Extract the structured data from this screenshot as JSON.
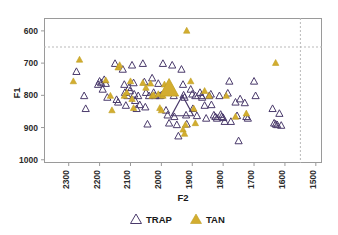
{
  "chart_data": {
    "type": "scatter",
    "title": "",
    "xlabel": "F2",
    "ylabel": "F1",
    "xlim": [
      2380,
      1480
    ],
    "ylim": [
      1010,
      560
    ],
    "x_inverted": true,
    "y_inverted": true,
    "grid": false,
    "legend_position": "bottom-center",
    "xticks": [
      2300,
      2200,
      2100,
      2000,
      1900,
      1800,
      1700,
      1600,
      1500
    ],
    "xtick_labels": [
      "2300",
      "2200",
      "2100",
      "2000",
      "1900",
      "1800",
      "1700",
      "1600",
      "1500"
    ],
    "yticks": [
      600,
      700,
      800,
      900,
      1000
    ],
    "ytick_labels": [
      "600",
      "700",
      "800",
      "900",
      "1000"
    ],
    "reference_lines": [
      {
        "orientation": "horizontal",
        "value": 650,
        "style": "dashed",
        "color": "#b9b9b9"
      },
      {
        "orientation": "vertical",
        "value": 1550,
        "style": "dashed",
        "color": "#b9b9b9"
      }
    ],
    "legend": [
      {
        "name": "TRAP",
        "marker": "triangle-open",
        "color": "#4a3a6b"
      },
      {
        "name": "TAN",
        "marker": "triangle-filled",
        "color": "#d3ad2f"
      }
    ],
    "series": [
      {
        "name": "TRAP",
        "marker": "triangle-open",
        "color": "#4a3a6b",
        "points": [
          [
            2275,
            725
          ],
          [
            2250,
            800
          ],
          [
            2245,
            840
          ],
          [
            2205,
            765
          ],
          [
            2200,
            755
          ],
          [
            2195,
            760
          ],
          [
            2190,
            780
          ],
          [
            2185,
            750
          ],
          [
            2180,
            762
          ],
          [
            2175,
            805
          ],
          [
            2150,
            700
          ],
          [
            2145,
            812
          ],
          [
            2140,
            820
          ],
          [
            2125,
            718
          ],
          [
            2120,
            765
          ],
          [
            2118,
            790
          ],
          [
            2115,
            830
          ],
          [
            2110,
            800
          ],
          [
            2105,
            775
          ],
          [
            2102,
            785
          ],
          [
            2095,
            705
          ],
          [
            2090,
            760
          ],
          [
            2088,
            795
          ],
          [
            2085,
            815
          ],
          [
            2080,
            840
          ],
          [
            2075,
            800
          ],
          [
            2070,
            828
          ],
          [
            2060,
            700
          ],
          [
            2055,
            757
          ],
          [
            2050,
            790
          ],
          [
            2052,
            835
          ],
          [
            2045,
            888
          ],
          [
            2040,
            800
          ],
          [
            2030,
            745
          ],
          [
            2025,
            790
          ],
          [
            2020,
            800
          ],
          [
            2010,
            762
          ],
          [
            2005,
            800
          ],
          [
            2000,
            798
          ],
          [
            1995,
            700
          ],
          [
            1990,
            790
          ],
          [
            1985,
            845
          ],
          [
            1980,
            860
          ],
          [
            1975,
            885
          ],
          [
            1965,
            705
          ],
          [
            1960,
            800
          ],
          [
            1958,
            865
          ],
          [
            1950,
            890
          ],
          [
            1945,
            925
          ],
          [
            1935,
            718
          ],
          [
            1930,
            765
          ],
          [
            1928,
            798
          ],
          [
            1925,
            805
          ],
          [
            1920,
            860
          ],
          [
            1918,
            888
          ],
          [
            1905,
            780
          ],
          [
            1900,
            795
          ],
          [
            1898,
            840
          ],
          [
            1890,
            800
          ],
          [
            1885,
            862
          ],
          [
            1875,
            790
          ],
          [
            1870,
            800
          ],
          [
            1868,
            805
          ],
          [
            1860,
            830
          ],
          [
            1855,
            870
          ],
          [
            1845,
            800
          ],
          [
            1840,
            795
          ],
          [
            1838,
            828
          ],
          [
            1830,
            860
          ],
          [
            1825,
            865
          ],
          [
            1820,
            870
          ],
          [
            1812,
            800
          ],
          [
            1808,
            858
          ],
          [
            1805,
            865
          ],
          [
            1800,
            868
          ],
          [
            1795,
            880
          ],
          [
            1785,
            792
          ],
          [
            1780,
            755
          ],
          [
            1775,
            880
          ],
          [
            1760,
            820
          ],
          [
            1755,
            862
          ],
          [
            1745,
            810
          ],
          [
            1750,
            940
          ],
          [
            1730,
            822
          ],
          [
            1725,
            865
          ],
          [
            1720,
            870
          ],
          [
            1700,
            755
          ],
          [
            1695,
            800
          ],
          [
            1640,
            840
          ],
          [
            1635,
            885
          ],
          [
            1630,
            888
          ],
          [
            1625,
            890
          ],
          [
            1618,
            855
          ],
          [
            1612,
            892
          ]
        ]
      },
      {
        "name": "TAN",
        "marker": "triangle-filled",
        "color": "#d3ad2f",
        "points": [
          [
            2285,
            755
          ],
          [
            2265,
            688
          ],
          [
            2180,
            752
          ],
          [
            2165,
            800
          ],
          [
            2160,
            845
          ],
          [
            2140,
            712
          ],
          [
            2135,
            705
          ],
          [
            2120,
            800
          ],
          [
            2112,
            790
          ],
          [
            2100,
            755
          ],
          [
            2095,
            810
          ],
          [
            2090,
            838
          ],
          [
            2060,
            760
          ],
          [
            2050,
            775
          ],
          [
            2035,
            762
          ],
          [
            2030,
            800
          ],
          [
            2025,
            798
          ],
          [
            2010,
            795
          ],
          [
            2005,
            838
          ],
          [
            2000,
            845
          ],
          [
            1995,
            800
          ],
          [
            1990,
            765
          ],
          [
            1930,
            905
          ],
          [
            1925,
            918
          ],
          [
            1922,
            890
          ],
          [
            1918,
            598
          ],
          [
            1905,
            755
          ],
          [
            1895,
            840
          ],
          [
            1890,
            885
          ],
          [
            1860,
            785
          ],
          [
            1845,
            800
          ],
          [
            1790,
            800
          ],
          [
            1760,
            865
          ],
          [
            1725,
            855
          ],
          [
            1630,
            698
          ]
        ]
      },
      {
        "name": "TRAP-centroid",
        "marker": "triangle-open-large",
        "color": "#4a3a6b",
        "points": [
          [
            1932,
            832
          ]
        ]
      },
      {
        "name": "TAN-centroid",
        "marker": "triangle-filled-large",
        "color": "#d3ad2f",
        "points": [
          [
            1975,
            775
          ]
        ]
      }
    ]
  },
  "layout": {
    "plot_left": 44,
    "plot_right": 322,
    "plot_top": 18,
    "plot_bottom": 163
  }
}
